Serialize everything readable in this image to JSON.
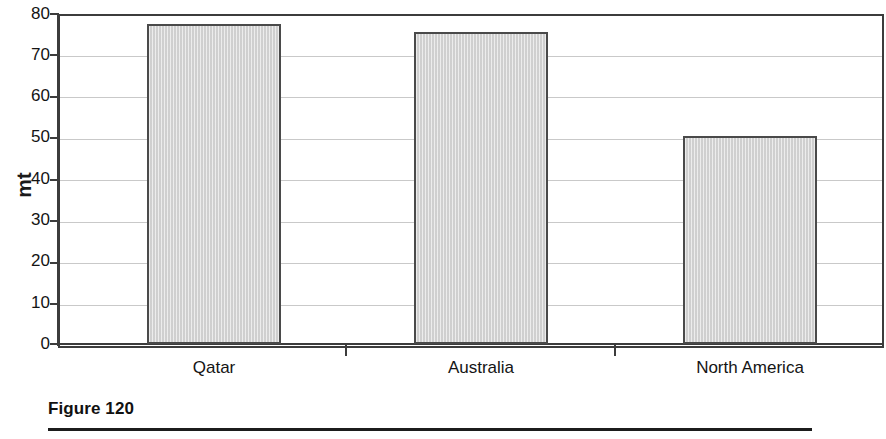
{
  "figure": {
    "caption": "Figure 120"
  },
  "chart_data": {
    "type": "bar",
    "title": "",
    "subtitle": "",
    "xlabel": "",
    "ylabel": "mt",
    "categories": [
      "Qatar",
      "Australia",
      "North America"
    ],
    "values": [
      77.6,
      75.6,
      50.4
    ],
    "ylim": [
      0,
      80
    ],
    "ytick_labels": [
      "80",
      "70",
      "60",
      "50",
      "40",
      "30",
      "20",
      "10",
      "0"
    ],
    "ytick_values": [
      80,
      70,
      60,
      50,
      40,
      30,
      20,
      10,
      0
    ],
    "ytick_step": 10,
    "grid": true,
    "grid_axis": "y",
    "legend": false,
    "legend_position": "none",
    "annotations": [],
    "series": [
      {
        "name": "mt",
        "values": [
          77.6,
          75.6,
          50.4
        ]
      }
    ]
  },
  "style": {
    "bar_fill": "#d6d6d6",
    "bar_border": "#4a4a4a",
    "axis_color": "#3c3c3c",
    "grid_color": "#c9c9c9",
    "text_color": "#141414",
    "background": "#ffffff"
  }
}
